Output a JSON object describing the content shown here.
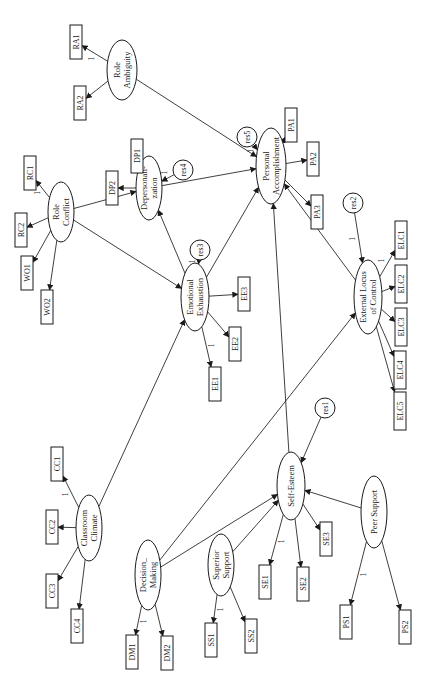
{
  "diagram": {
    "type": "structural-equation-model",
    "orientation": "rotated-90-ccw",
    "colors": {
      "stroke": "#1a1a1a",
      "fill": "#ffffff",
      "background": "#ffffff"
    },
    "latent": [
      {
        "id": "RoleAmb",
        "lines": [
          "Role",
          "Ambiguity"
        ]
      },
      {
        "id": "RoleCon",
        "lines": [
          "Role",
          "Conflict"
        ]
      },
      {
        "id": "Deper",
        "lines": [
          "Depersonali-",
          "zation"
        ]
      },
      {
        "id": "EmoEx",
        "lines": [
          "Emotional",
          "Exhaustion"
        ]
      },
      {
        "id": "PersAcc",
        "lines": [
          "Personal",
          "Accomplishment"
        ]
      },
      {
        "id": "ELC",
        "lines": [
          "External Locus",
          "of Control"
        ]
      },
      {
        "id": "ClassClim",
        "lines": [
          "Classroom",
          "Climate"
        ]
      },
      {
        "id": "DecMak",
        "lines": [
          "Decision_",
          "Making"
        ]
      },
      {
        "id": "SupSup",
        "lines": [
          "Superior",
          "Support"
        ]
      },
      {
        "id": "SelfEst",
        "lines": [
          "Self-Esteem"
        ]
      },
      {
        "id": "PeerSup",
        "lines": [
          "Peer Support"
        ]
      }
    ],
    "observed": [
      {
        "id": "RA1",
        "label": "RA1",
        "of": "RoleAmb",
        "fixed": "1"
      },
      {
        "id": "RA2",
        "label": "RA2",
        "of": "RoleAmb"
      },
      {
        "id": "RC1",
        "label": "RC1",
        "of": "RoleCon",
        "fixed": "1"
      },
      {
        "id": "RC2",
        "label": "RC2",
        "of": "RoleCon"
      },
      {
        "id": "WO1",
        "label": "WO1",
        "of": "RoleCon"
      },
      {
        "id": "WO2",
        "label": "WO2",
        "of": "RoleCon"
      },
      {
        "id": "DP1",
        "label": "DP1",
        "of": "Deper",
        "fixed": "1"
      },
      {
        "id": "DP2",
        "label": "DP2",
        "of": "Deper"
      },
      {
        "id": "EE1",
        "label": "EE1",
        "of": "EmoEx",
        "fixed": "1"
      },
      {
        "id": "EE2",
        "label": "EE2",
        "of": "EmoEx"
      },
      {
        "id": "EE3",
        "label": "EE3",
        "of": "EmoEx"
      },
      {
        "id": "PA1",
        "label": "PA1",
        "of": "PersAcc",
        "fixed": "1"
      },
      {
        "id": "PA2",
        "label": "PA2",
        "of": "PersAcc"
      },
      {
        "id": "PA3",
        "label": "PA3",
        "of": "PersAcc"
      },
      {
        "id": "ELC1",
        "label": "ELC1",
        "of": "ELC",
        "fixed": "1"
      },
      {
        "id": "ELC2",
        "label": "ELC2",
        "of": "ELC"
      },
      {
        "id": "ELC3",
        "label": "ELC3",
        "of": "ELC"
      },
      {
        "id": "ELC4",
        "label": "ELC4",
        "of": "ELC"
      },
      {
        "id": "ELC5",
        "label": "ELC5",
        "of": "ELC"
      },
      {
        "id": "CC1",
        "label": "CC1",
        "of": "ClassClim",
        "fixed": "1"
      },
      {
        "id": "CC2",
        "label": "CC2",
        "of": "ClassClim"
      },
      {
        "id": "CC3",
        "label": "CC3",
        "of": "ClassClim"
      },
      {
        "id": "CC4",
        "label": "CC4",
        "of": "ClassClim"
      },
      {
        "id": "DM1",
        "label": "DM1",
        "of": "DecMak",
        "fixed": "1"
      },
      {
        "id": "DM2",
        "label": "DM2",
        "of": "DecMak"
      },
      {
        "id": "SS1",
        "label": "SS1",
        "of": "SupSup",
        "fixed": "1"
      },
      {
        "id": "SS2",
        "label": "SS2",
        "of": "SupSup"
      },
      {
        "id": "SE1",
        "label": "SE1",
        "of": "SelfEst",
        "fixed": "1"
      },
      {
        "id": "SE2",
        "label": "SE2",
        "of": "SelfEst"
      },
      {
        "id": "SE3",
        "label": "SE3",
        "of": "SelfEst"
      },
      {
        "id": "PS1",
        "label": "PS1",
        "of": "PeerSup",
        "fixed": "1"
      },
      {
        "id": "PS2",
        "label": "PS2",
        "of": "PeerSup"
      }
    ],
    "residuals": [
      {
        "id": "res1",
        "label": "res1",
        "to": "SelfEst",
        "fixed": ""
      },
      {
        "id": "res2",
        "label": "res2",
        "to": "ELC",
        "fixed": "1"
      },
      {
        "id": "res3",
        "label": "res3",
        "to": "EmoEx",
        "fixed": "1"
      },
      {
        "id": "res4",
        "label": "res4",
        "to": "Deper",
        "fixed": "1"
      },
      {
        "id": "res5",
        "label": "res5",
        "to": "PersAcc",
        "fixed": "1"
      }
    ],
    "paths": [
      {
        "from": "RoleAmb",
        "to": "PersAcc"
      },
      {
        "from": "RoleCon",
        "to": "Deper"
      },
      {
        "from": "RoleCon",
        "to": "EmoEx"
      },
      {
        "from": "EmoEx",
        "to": "Deper"
      },
      {
        "from": "EmoEx",
        "to": "PersAcc"
      },
      {
        "from": "Deper",
        "to": "PersAcc"
      },
      {
        "from": "ELC",
        "to": "PersAcc"
      },
      {
        "from": "SelfEst",
        "to": "PersAcc"
      },
      {
        "from": "ClassClim",
        "to": "EmoEx"
      },
      {
        "from": "DecMak",
        "to": "ELC"
      },
      {
        "from": "DecMak",
        "to": "SelfEst"
      },
      {
        "from": "SupSup",
        "to": "SelfEst"
      },
      {
        "from": "PeerSup",
        "to": "SelfEst"
      }
    ]
  }
}
